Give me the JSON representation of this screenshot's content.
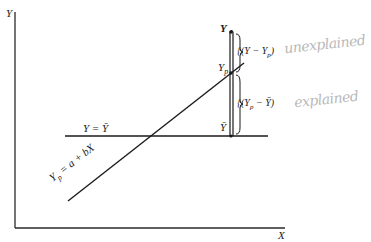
{
  "diagram": {
    "axes": {
      "y_label": "Y",
      "x_label": "X"
    },
    "lines": {
      "mean_line_label": "Y = Ȳ",
      "regression_label": "Yp = a + bX",
      "regression_label_main": "Y",
      "regression_label_sub": "p",
      "regression_label_rest": " = a + bX"
    },
    "points": {
      "observed": "Y",
      "predicted_main": "Y",
      "predicted_sub": "p",
      "mean": "Ȳ"
    },
    "brackets": {
      "upper_main": "{(Y − Y",
      "upper_sub": "p",
      "upper_close": ")",
      "lower_main": "{(Y",
      "lower_sub": "p",
      "lower_rest": " − Ȳ)"
    },
    "annotations": {
      "unexplained": "unexplained",
      "explained": "explained"
    },
    "colors": {
      "ink": "#1a1a1a",
      "pencil": "#b8b8b8"
    }
  }
}
